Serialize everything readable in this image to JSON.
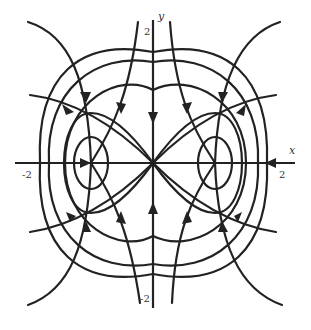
{
  "diagram": {
    "type": "phase-portrait",
    "axes": {
      "x_label": "x",
      "y_label": "y",
      "x_ticks": [
        "-2",
        "2"
      ],
      "y_ticks": [
        "2",
        "-2"
      ]
    },
    "equilibria": [
      {
        "name": "saddle",
        "x": 0,
        "y": 0
      },
      {
        "name": "center-left",
        "x": -1,
        "y": 0
      },
      {
        "name": "center-right",
        "x": 1,
        "y": 0
      }
    ],
    "colors": {
      "stroke": "#222222",
      "background": "#ffffff"
    }
  }
}
